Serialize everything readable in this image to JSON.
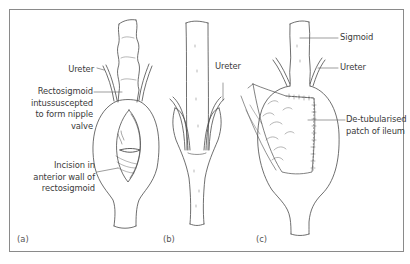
{
  "figure": {
    "type": "surgical anatomy line drawing",
    "panels": [
      {
        "id": "a",
        "letter": "(a)",
        "labels": {
          "ureter": "Ureter",
          "rectosigmoid_line1": "Rectosigmoid",
          "rectosigmoid_line2": "intussuscepted",
          "rectosigmoid_line3": "to form nipple",
          "rectosigmoid_line4": "valve",
          "incision_line1": "Incision in",
          "incision_line2": "anterior wall of",
          "incision_line3": "rectosigmoid"
        }
      },
      {
        "id": "b",
        "letter": "(b)",
        "labels": {
          "ureter": "Ureter"
        }
      },
      {
        "id": "c",
        "letter": "(c)",
        "labels": {
          "sigmoid": "Sigmoid",
          "ureter": "Ureter",
          "patch_line1": "De-tubularised",
          "patch_line2": "patch of ileum"
        }
      }
    ]
  },
  "colors": {
    "frame": "#8a8a8a",
    "line_art": "#4a4a4a",
    "label_text": "#3a3a3a",
    "leader_line": "#5a5a5a"
  }
}
